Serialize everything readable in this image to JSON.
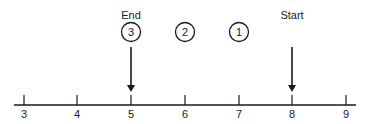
{
  "diagram": {
    "labels": {
      "end": "End",
      "start": "Start"
    },
    "steps": [
      "3",
      "2",
      "1"
    ],
    "axis_ticks": [
      "3",
      "4",
      "5",
      "6",
      "7",
      "8",
      "9"
    ],
    "colors": {
      "stroke": "#1a1a1a",
      "background": "#ffffff"
    }
  }
}
